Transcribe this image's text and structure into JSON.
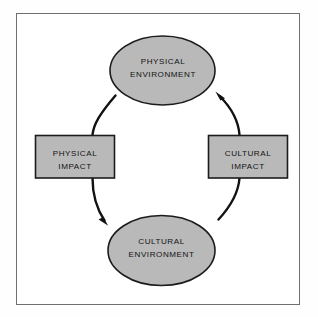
{
  "diagram": {
    "type": "cycle-diagram",
    "flow_direction": "clockwise",
    "colors": {
      "page_background": "#fefefe",
      "panel_background": "#ffffff",
      "panel_border": "#6d6f72",
      "node_fill": "#b9b9b9",
      "node_stroke": "#1c1c1c",
      "arrow_stroke": "#121212",
      "label_text": "#131313"
    },
    "nodes": [
      {
        "id": "physical-environment",
        "shape": "ellipse",
        "line1": "PHYSICAL",
        "line2": "ENVIRONMENT",
        "position": "top"
      },
      {
        "id": "cultural-environment",
        "shape": "ellipse",
        "line1": "CULTURAL",
        "line2": "ENVIRONMENT",
        "position": "bottom"
      },
      {
        "id": "physical-impact",
        "shape": "rectangle",
        "line1": "PHYSICAL",
        "line2": "IMPACT",
        "position": "left"
      },
      {
        "id": "cultural-impact",
        "shape": "rectangle",
        "line1": "CULTURAL",
        "line2": "IMPACT",
        "position": "right"
      }
    ],
    "arrows": [
      {
        "id": "physical-environment-to-cultural-environment",
        "from": "physical-environment",
        "to": "cultural-environment",
        "via": "physical-impact",
        "side": "left",
        "arrowhead": "at-cultural-environment"
      },
      {
        "id": "cultural-environment-to-physical-environment",
        "from": "cultural-environment",
        "to": "physical-environment",
        "via": "cultural-impact",
        "side": "right",
        "arrowhead": "at-physical-environment"
      }
    ]
  }
}
